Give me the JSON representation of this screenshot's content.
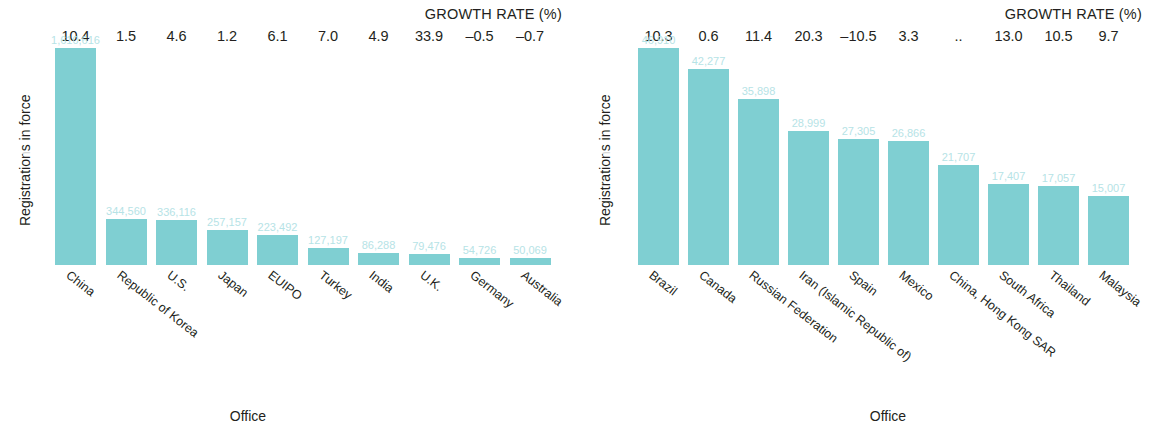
{
  "chart_data": [
    {
      "type": "bar",
      "panel": "left",
      "title": "",
      "growth_header": "GROWTH RATE (%)",
      "xlabel": "Office",
      "ylabel": "Registrations in force",
      "ylim": [
        0,
        1610616
      ],
      "grid": false,
      "legend": "none",
      "categories": [
        "China",
        "Republic of Korea",
        "U.S.",
        "Japan",
        "EUIPO",
        "Turkey",
        "India",
        "U.K.",
        "Germany",
        "Australia"
      ],
      "values": [
        1610616,
        344560,
        336116,
        257157,
        223492,
        127197,
        86288,
        79476,
        54726,
        50069
      ],
      "value_labels": [
        "1,610,616",
        "344,560",
        "336,116",
        "257,157",
        "223,492",
        "127,197",
        "86,288",
        "79,476",
        "54,726",
        "50,069"
      ],
      "growth_rates": [
        "10.4",
        "1.5",
        "4.6",
        "1.2",
        "6.1",
        "7.0",
        "4.9",
        "33.9",
        "–0.5",
        "–0.7"
      ]
    },
    {
      "type": "bar",
      "panel": "right",
      "title": "",
      "growth_header": "GROWTH RATE (%)",
      "xlabel": "Office",
      "ylabel": "Registrations in force",
      "ylim": [
        0,
        46910
      ],
      "grid": false,
      "legend": "none",
      "categories": [
        "Brazil",
        "Canada",
        "Russian Federation",
        "Iran (Islamic Republic of)",
        "Spain",
        "Mexico",
        "China, Hong Kong SAR",
        "South Africa",
        "Thailand",
        "Malaysia"
      ],
      "values": [
        46910,
        42277,
        35898,
        28999,
        27305,
        26866,
        21707,
        17407,
        17057,
        15007
      ],
      "value_labels": [
        "46,910",
        "42,277",
        "35,898",
        "28,999",
        "27,305",
        "26,866",
        "21,707",
        "17,407",
        "17,057",
        "15,007"
      ],
      "growth_rates": [
        "10.3",
        "0.6",
        "11.4",
        "20.3",
        "–10.5",
        "3.3",
        "..",
        "13.0",
        "10.5",
        "9.7"
      ]
    }
  ],
  "style": {
    "bar_color": "#7fcfd2",
    "value_label_color": "#b6e3e6",
    "text_color": "#231f20",
    "background": "#ffffff"
  }
}
